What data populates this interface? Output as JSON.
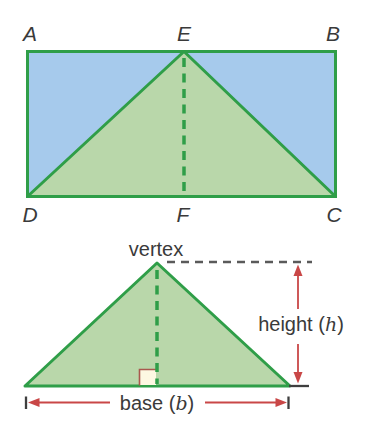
{
  "colors": {
    "green_stroke": "#2f9e48",
    "green_fill": "#b9d7aa",
    "blue_fill": "#a6caec",
    "red": "#c94747",
    "label_text": "#3a3a3a",
    "dash_gray": "#5a5a5a",
    "tick_dark": "#3f3f3f",
    "square_fill": "#fdf8e2",
    "square_border": "#a9584e"
  },
  "top_figure": {
    "description": "Rectangle ABCD with inscribed triangle DEC and dashed altitude EF",
    "labels": {
      "top_left": "A",
      "top_mid": "E",
      "top_right": "B",
      "bottom_left": "D",
      "bottom_mid": "F",
      "bottom_right": "C"
    }
  },
  "bottom_figure": {
    "description": "Triangle with labeled vertex, height and base measurements",
    "vertex_label": "vertex",
    "height_label": {
      "prefix": "height (",
      "variable": "h",
      "suffix": ")"
    },
    "base_label": {
      "prefix": "base (",
      "variable": "b",
      "suffix": ")"
    }
  }
}
